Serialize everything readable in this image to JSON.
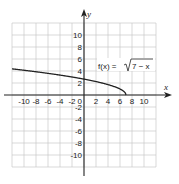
{
  "chart_data": {
    "type": "line",
    "title": "",
    "function_label": "f(x) = √(7 − x)",
    "function_label_parts": {
      "lhs": "f(x) =",
      "radicand": "7 − x"
    },
    "xlabel": "x",
    "ylabel": "y",
    "xlim": [
      -12,
      12
    ],
    "ylim": [
      -12,
      12
    ],
    "grid": true,
    "grid_step": 2,
    "x_ticks": [
      -10,
      -8,
      -6,
      -4,
      -2,
      0,
      2,
      4,
      6,
      8,
      10
    ],
    "x_tick_labels": [
      "-10",
      "-8",
      "-6",
      "-4",
      "-2",
      "0",
      "2",
      "4",
      "6",
      "8",
      "10"
    ],
    "y_ticks": [
      10,
      8,
      6,
      4,
      2,
      -2,
      -4,
      -6,
      -8,
      -10
    ],
    "y_tick_labels": [
      "10",
      "8",
      "6",
      "4",
      "2",
      "-2",
      "-4",
      "-6",
      "-8",
      "-10"
    ],
    "series": [
      {
        "name": "f(x) = √(7 − x)",
        "x": [
          -12,
          -10,
          -8,
          -6,
          -4,
          -2,
          0,
          2,
          4,
          6,
          6.5,
          7
        ],
        "values": [
          4.36,
          4.12,
          3.87,
          3.61,
          3.32,
          3.0,
          2.65,
          2.24,
          1.73,
          1.0,
          0.71,
          0
        ]
      }
    ]
  },
  "colors": {
    "grid": "#c8c8c8",
    "axis": "#222222",
    "curve": "#222222",
    "background": "#ffffff"
  },
  "layout": {
    "origin_px": [
      84,
      95
    ],
    "px_per_unit": 6,
    "grid_px": {
      "left": 12,
      "top": 23,
      "right": 156,
      "bottom": 167
    }
  }
}
